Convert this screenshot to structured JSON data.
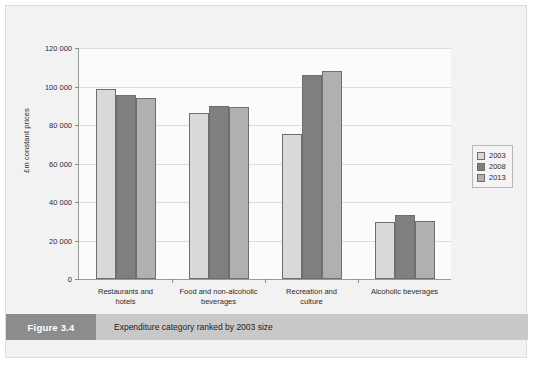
{
  "figure": {
    "tag": "Figure 3.4",
    "caption": "Expenditure category ranked by 2003 size"
  },
  "chart_data": {
    "type": "bar",
    "title": "",
    "xlabel": "",
    "ylabel": "£m constant prices",
    "ylim": [
      0,
      120000
    ],
    "ytick_labels": [
      "120 000",
      "100 000",
      "80 000",
      "60 000",
      "40 000",
      "20 000",
      "0"
    ],
    "ytick_values": [
      120000,
      100000,
      80000,
      60000,
      40000,
      20000,
      0
    ],
    "grid": true,
    "legend_position": "right",
    "categories": [
      "Restaurants and hotels",
      "Food and non-alcoholic beverages",
      "Recreation and culture",
      "Alcoholic beverages"
    ],
    "category_lines": [
      [
        "Restaurants and",
        "hotels"
      ],
      [
        "Food and non-alcoholic",
        "beverages"
      ],
      [
        "Recreation and",
        "culture"
      ],
      [
        "Alcoholic beverages",
        ""
      ]
    ],
    "series": [
      {
        "name": "2003",
        "color": "#d9d9d9",
        "values": [
          98500,
          86500,
          75500,
          29500
        ]
      },
      {
        "name": "2008",
        "color": "#7f7f7f",
        "values": [
          95800,
          90000,
          106000,
          33000
        ]
      },
      {
        "name": "2013",
        "color": "#b0b0b0",
        "values": [
          94200,
          89500,
          108000,
          30200
        ]
      }
    ]
  }
}
